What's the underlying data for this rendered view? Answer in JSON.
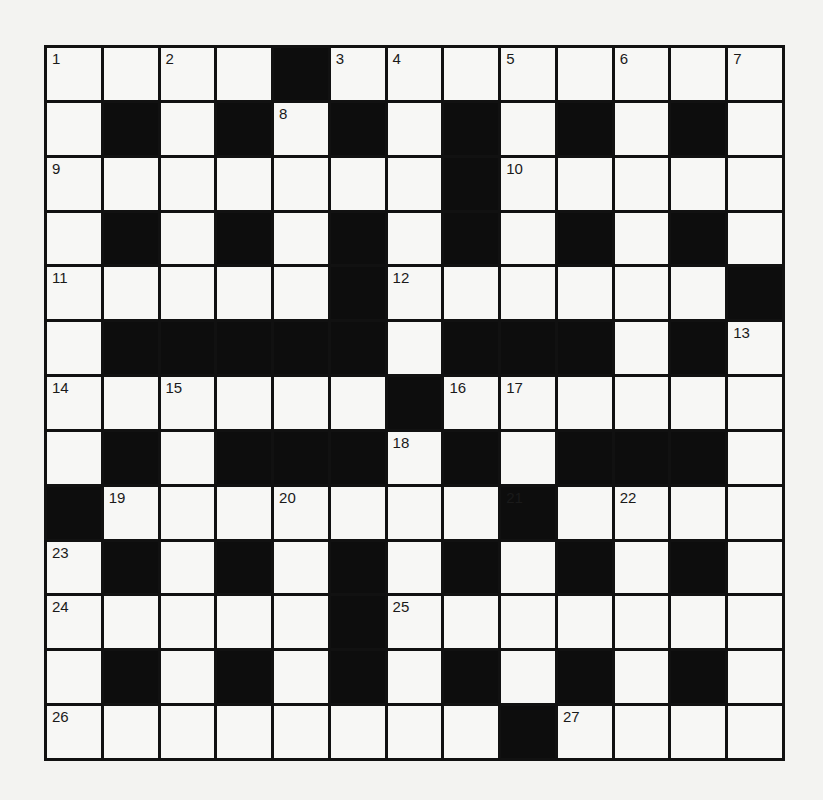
{
  "puzzle": {
    "rows": 13,
    "cols": 13,
    "grid": [
      "....#........",
      ".#.#.#.#.#.#.",
      ".......#.....",
      ".#.#.#.#.#.#.",
      ".....#......#",
      ".#####.###.#.",
      "......#......",
      ".#.###.#.###.",
      "#.......#....",
      ".#.#.#.#.#.#.",
      ".....#.......",
      ".#.#.#.#.#.#.",
      "........#...."
    ],
    "numbers": [
      {
        "r": 0,
        "c": 0,
        "n": "1"
      },
      {
        "r": 0,
        "c": 2,
        "n": "2"
      },
      {
        "r": 0,
        "c": 5,
        "n": "3"
      },
      {
        "r": 0,
        "c": 6,
        "n": "4"
      },
      {
        "r": 0,
        "c": 8,
        "n": "5"
      },
      {
        "r": 0,
        "c": 10,
        "n": "6"
      },
      {
        "r": 0,
        "c": 12,
        "n": "7"
      },
      {
        "r": 1,
        "c": 4,
        "n": "8"
      },
      {
        "r": 2,
        "c": 0,
        "n": "9"
      },
      {
        "r": 2,
        "c": 8,
        "n": "10"
      },
      {
        "r": 4,
        "c": 0,
        "n": "11"
      },
      {
        "r": 4,
        "c": 6,
        "n": "12"
      },
      {
        "r": 5,
        "c": 12,
        "n": "13"
      },
      {
        "r": 6,
        "c": 0,
        "n": "14"
      },
      {
        "r": 6,
        "c": 2,
        "n": "15"
      },
      {
        "r": 6,
        "c": 7,
        "n": "16"
      },
      {
        "r": 6,
        "c": 8,
        "n": "17"
      },
      {
        "r": 7,
        "c": 6,
        "n": "18"
      },
      {
        "r": 8,
        "c": 1,
        "n": "19"
      },
      {
        "r": 8,
        "c": 4,
        "n": "20"
      },
      {
        "r": 8,
        "c": 8,
        "n": "21"
      },
      {
        "r": 8,
        "c": 10,
        "n": "22"
      },
      {
        "r": 9,
        "c": 0,
        "n": "23"
      },
      {
        "r": 10,
        "c": 0,
        "n": "24"
      },
      {
        "r": 10,
        "c": 6,
        "n": "25"
      },
      {
        "r": 12,
        "c": 0,
        "n": "26"
      },
      {
        "r": 12,
        "c": 9,
        "n": "27"
      }
    ]
  }
}
